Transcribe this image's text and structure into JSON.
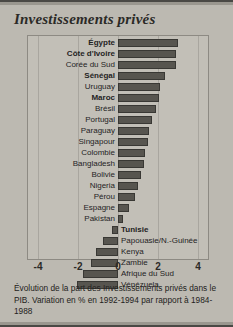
{
  "title": "Investissements privés",
  "caption": "Évolution de la part des Investissements privés dans le PIB. Variation en % en 1992-1994 par rapport à 1984-1988",
  "colors": {
    "background": "#bcb9b1",
    "plot_background": "#c2bfb7",
    "bar": "#57554f",
    "bar_border": "#393834",
    "text": "#24231f",
    "frame": "#8d8a83"
  },
  "chart_data": {
    "type": "bar",
    "orientation": "horizontal",
    "title": "Investissements privés",
    "subtitle": "Évolution de la part des Investissements privés dans le PIB. Variation en % en 1992-1994 par rapport à 1984-1988",
    "xlabel": "",
    "ylabel": "",
    "xlim": [
      -4.5,
      4.5
    ],
    "xticks": [
      "-4",
      "-2",
      "0",
      "2",
      "4"
    ],
    "xtick_values": [
      -4,
      -2,
      0,
      2,
      4
    ],
    "grid": true,
    "legend": false,
    "unit": "%",
    "categories": [
      "Égypte",
      "Côte d'Ivoire",
      "Corée du Sud",
      "Sénégal",
      "Uruguay",
      "Maroc",
      "Brésil",
      "Portugal",
      "Paraguay",
      "Singapour",
      "Colombie",
      "Bangladesh",
      "Bolivie",
      "Nigeria",
      "Pérou",
      "Espagne",
      "Pakistan",
      "Tunisie",
      "Papouasie/N.-Guinée",
      "Kenya",
      "Zambie",
      "Afrique du Sud",
      "Vénézuela"
    ],
    "values": [
      3.0,
      2.9,
      2.9,
      2.35,
      2.1,
      2.05,
      1.9,
      1.7,
      1.55,
      1.5,
      1.35,
      1.3,
      1.15,
      1.0,
      0.85,
      0.55,
      0.25,
      -0.3,
      -0.75,
      -1.1,
      -1.35,
      -1.75,
      -2.05
    ],
    "highlighted": [
      "Égypte",
      "Côte d'Ivoire",
      "Sénégal",
      "Maroc",
      "Tunisie"
    ]
  }
}
